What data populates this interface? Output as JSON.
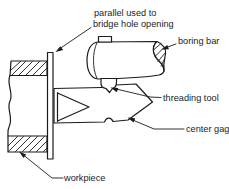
{
  "diagram": {
    "labels": {
      "parallel_line1": "parallel used to",
      "parallel_line2": "bridge hole opening",
      "boring_bar": "boring bar",
      "threading_tool": "threading tool",
      "center_gage": "center gage",
      "workpiece": "workpiece"
    },
    "colors": {
      "ink": "#1b1b1b",
      "background": "#ffffff"
    }
  }
}
